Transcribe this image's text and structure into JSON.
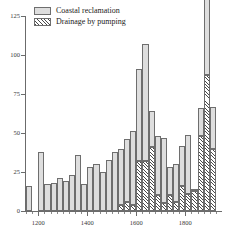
{
  "top_partial_text": "",
  "legend": {
    "position": "top-left-inside",
    "items": [
      {
        "label": "Coastal reclamation",
        "swatch": "coastal",
        "color": "#dedede"
      },
      {
        "label": "Drainage by pumping",
        "swatch": "drain",
        "color": "#4a4a4a"
      }
    ]
  },
  "axes": {
    "y_ticks": [
      "0",
      "25",
      "50",
      "75",
      "100",
      "125"
    ],
    "x_ticks": [
      "1200",
      "1400",
      "1600",
      "1800"
    ]
  },
  "chart_data": {
    "type": "bar",
    "title": "",
    "subtitle": "",
    "xlabel": "",
    "ylabel": "",
    "stacked": true,
    "grid": false,
    "legend_position": "top-left",
    "bin_width_years": 25,
    "xlim": [
      1150,
      1950
    ],
    "ylim": [
      0,
      125
    ],
    "yticks": [
      0,
      25,
      50,
      75,
      100,
      125
    ],
    "xticks": [
      1200,
      1400,
      1600,
      1800
    ],
    "x": [
      1150,
      1175,
      1200,
      1225,
      1250,
      1275,
      1300,
      1325,
      1350,
      1375,
      1400,
      1425,
      1450,
      1475,
      1500,
      1525,
      1550,
      1575,
      1600,
      1625,
      1650,
      1675,
      1700,
      1725,
      1750,
      1775,
      1800,
      1825,
      1850,
      1875,
      1900
    ],
    "categories": [
      "1150",
      "1175",
      "1200",
      "1225",
      "1250",
      "1275",
      "1300",
      "1325",
      "1350",
      "1375",
      "1400",
      "1425",
      "1450",
      "1475",
      "1500",
      "1525",
      "1550",
      "1575",
      "1600",
      "1625",
      "1650",
      "1675",
      "1700",
      "1725",
      "1750",
      "1775",
      "1800",
      "1825",
      "1850",
      "1875",
      "1900"
    ],
    "series": [
      {
        "name": "Coastal reclamation",
        "color": "#dedede",
        "values": [
          16,
          0,
          38,
          17,
          18,
          21,
          19,
          23,
          36,
          17,
          28,
          30,
          25,
          33,
          38,
          36,
          40,
          47,
          59,
          75,
          23,
          38,
          42,
          18,
          24,
          26,
          38,
          1,
          18,
          50,
          27
        ]
      },
      {
        "name": "Drainage by pumping",
        "color": "#4a4a4a",
        "values": [
          0,
          0,
          0,
          0,
          0,
          0,
          0,
          0,
          0,
          0,
          0,
          0,
          0,
          0,
          0,
          4,
          6,
          4,
          32,
          32,
          41,
          10,
          5,
          10,
          6,
          16,
          11,
          13,
          48,
          87,
          40
        ]
      }
    ],
    "totals": [
      16,
      0,
      38,
      17,
      18,
      21,
      19,
      23,
      36,
      17,
      28,
      30,
      25,
      33,
      38,
      40,
      46,
      51,
      91,
      107,
      64,
      48,
      47,
      28,
      30,
      42,
      49,
      14,
      66,
      137,
      67
    ]
  }
}
